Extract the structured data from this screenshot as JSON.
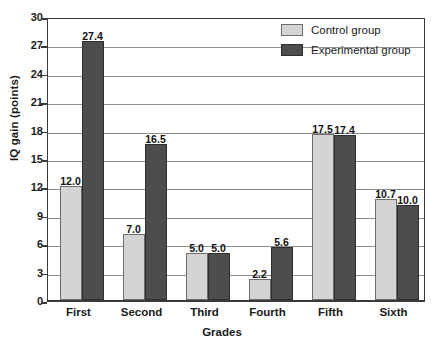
{
  "chart_data": {
    "type": "bar",
    "title": "",
    "subtitle": "",
    "xlabel": "Grades",
    "ylabel": "IQ gain (points)",
    "categories": [
      "First",
      "Second",
      "Third",
      "Fourth",
      "Fifth",
      "Sixth"
    ],
    "series": [
      {
        "name": "Control group",
        "color": "#d4d4d4",
        "values": [
          12.0,
          7.0,
          5.0,
          2.2,
          17.5,
          10.7
        ],
        "labels": [
          "12.0",
          "7.0",
          "5.0",
          "2.2",
          "17.5",
          "10.7"
        ]
      },
      {
        "name": "Experimental group",
        "color": "#4d4d4d",
        "values": [
          27.4,
          16.5,
          5.0,
          5.6,
          17.4,
          10.0
        ],
        "labels": [
          "27.4",
          "16.5",
          "5.0",
          "5.6",
          "17.4",
          "10.0"
        ]
      }
    ],
    "ylim": [
      0,
      30
    ],
    "yticks": [
      0,
      3,
      6,
      9,
      12,
      15,
      18,
      21,
      24,
      27,
      30
    ],
    "ytick_labels": [
      "0",
      "3",
      "6",
      "9",
      "12",
      "15",
      "18",
      "21",
      "24",
      "27",
      "30"
    ],
    "grid": true,
    "grid_axis": "y",
    "legend_position": "top-right",
    "legend": [
      "Control group",
      "Experimental group"
    ]
  }
}
